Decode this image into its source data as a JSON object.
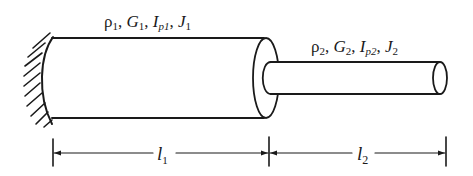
{
  "diagram": {
    "type": "stepped-shaft-torsion",
    "colors": {
      "ink": "#1a1a1a",
      "background": "#ffffff"
    },
    "wall": {
      "label": "fixed-support"
    },
    "segment1": {
      "props": {
        "rho": "ρ",
        "rho_sub": "1",
        "G": "G",
        "G_sub": "1",
        "Ip": "I",
        "Ip_sub": "p1",
        "J": "J",
        "J_sub": "1"
      },
      "length": {
        "symbol": "l",
        "sub": "1"
      }
    },
    "segment2": {
      "props": {
        "rho": "ρ",
        "rho_sub": "2",
        "G": "G",
        "G_sub": "2",
        "Ip": "I",
        "Ip_sub": "p2",
        "J": "J",
        "J_sub": "2"
      },
      "length": {
        "symbol": "l",
        "sub": "2"
      }
    },
    "separator": ", "
  }
}
